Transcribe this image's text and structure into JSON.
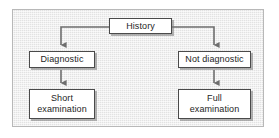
{
  "figure": {
    "frame": {
      "border_color": "#b8b8b8",
      "background_color": "#ececec"
    },
    "node_style": {
      "fill": "#ffffff",
      "border_color": "#4a4a4a",
      "shadow_color": "#787878",
      "text_color": "#1e1e1e"
    },
    "connector_color": "#6e6e6e"
  },
  "nodes": {
    "history": {
      "label": "History"
    },
    "diagnostic": {
      "label": "Diagnostic"
    },
    "not_diagnostic": {
      "label": "Not diagnostic"
    },
    "short_examination": {
      "label": "Short\nexamination"
    },
    "full_examination": {
      "label": "Full\nexamination"
    }
  },
  "edges": [
    {
      "from": "history",
      "to": "diagnostic",
      "label": ""
    },
    {
      "from": "history",
      "to": "not_diagnostic",
      "label": ""
    },
    {
      "from": "diagnostic",
      "to": "short_examination",
      "label": ""
    },
    {
      "from": "not_diagnostic",
      "to": "full_examination",
      "label": ""
    }
  ]
}
